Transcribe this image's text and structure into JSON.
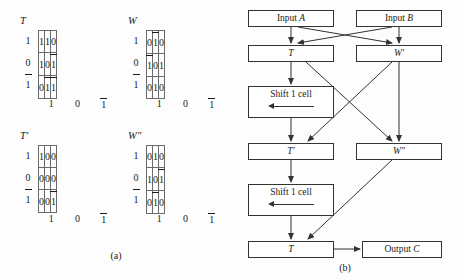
{
  "figure": {
    "captions": {
      "a": "(a)",
      "b": "(b)"
    }
  },
  "panel_a": {
    "tables": [
      {
        "name": "table-T",
        "title": "T",
        "row_labels": [
          "1",
          "0",
          "1̅"
        ],
        "col_labels": [
          "1",
          "0",
          "1̅"
        ],
        "cells": [
          [
            "1",
            "1",
            "0"
          ],
          [
            "1",
            "0",
            "1̅"
          ],
          [
            "0",
            "1̅",
            "1̅"
          ]
        ]
      },
      {
        "name": "table-W",
        "title": "W",
        "row_labels": [
          "1",
          "0",
          "1̅"
        ],
        "col_labels": [
          "1",
          "0",
          "1̅"
        ],
        "cells": [
          [
            "0",
            "1̅",
            "0"
          ],
          [
            "1̅",
            "0",
            "1"
          ],
          [
            "0",
            "1",
            "0"
          ]
        ]
      },
      {
        "name": "table-T-prime",
        "title": "T′",
        "row_labels": [
          "1",
          "0",
          "1̅"
        ],
        "col_labels": [
          "1",
          "0",
          "1̅"
        ],
        "cells": [
          [
            "1",
            "0",
            "0"
          ],
          [
            "0",
            "0",
            "0"
          ],
          [
            "0",
            "0",
            "1̅"
          ]
        ]
      },
      {
        "name": "table-W-double-prime",
        "title": "W″",
        "row_labels": [
          "1",
          "0",
          "1̅"
        ],
        "col_labels": [
          "1",
          "0",
          "1̅"
        ],
        "cells": [
          [
            "0",
            "1",
            "0"
          ],
          [
            "1",
            "0",
            "1̅"
          ],
          [
            "0",
            "1̅",
            "0"
          ]
        ]
      }
    ]
  },
  "panel_b": {
    "nodes": [
      {
        "id": "input-a",
        "label_plain": "Input ",
        "label_italic": "A"
      },
      {
        "id": "input-b",
        "label_plain": "Input ",
        "label_italic": "B"
      },
      {
        "id": "node-t",
        "label_plain": "",
        "label_italic": "T"
      },
      {
        "id": "node-w-prime",
        "label_plain": "",
        "label_italic": "W′"
      },
      {
        "id": "shift-1",
        "label_plain": "Shift 1 cell",
        "label_italic": ""
      },
      {
        "id": "node-t-prime",
        "label_plain": "",
        "label_italic": "T′"
      },
      {
        "id": "node-w-dprime",
        "label_plain": "",
        "label_italic": "W″"
      },
      {
        "id": "shift-2",
        "label_plain": "Shift 1 cell",
        "label_italic": ""
      },
      {
        "id": "node-t-out",
        "label_plain": "",
        "label_italic": "T"
      },
      {
        "id": "output-c",
        "label_plain": "Output ",
        "label_italic": "C"
      }
    ]
  },
  "colors": {
    "ink": "#1a1a1a",
    "rule": "#4a4a4a",
    "page": "#fdfdfd"
  }
}
